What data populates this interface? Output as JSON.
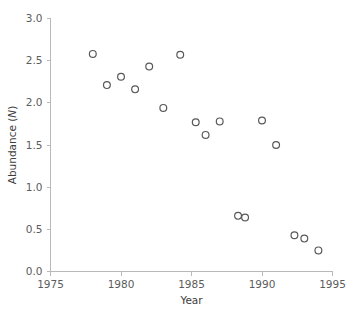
{
  "chart_data": {
    "type": "scatter",
    "title": "",
    "xlabel": "Year",
    "ylabel": "Abundance (N)",
    "ylabel_plain": "Abundance (",
    "ylabel_italic": "N",
    "ylabel_close": ")",
    "xlim": [
      1975,
      1995
    ],
    "ylim": [
      0.0,
      3.0
    ],
    "xticks": [
      1975,
      1980,
      1985,
      1990,
      1995
    ],
    "xticklabels": [
      "1975",
      "1980",
      "1985",
      "1990",
      "1995"
    ],
    "yticks": [
      0.0,
      0.5,
      1.0,
      1.5,
      2.0,
      2.5,
      3.0
    ],
    "yticklabels": [
      "0.0",
      "0.5",
      "1.0",
      "1.5",
      "2.0",
      "2.5",
      "3.0"
    ],
    "grid": false,
    "legend": null,
    "marker": "open-circle",
    "marker_color": "#585858",
    "x": [
      1978.0,
      1979.0,
      1980.0,
      1981.0,
      1981.5,
      1982.0,
      1983.0,
      1984.2,
      1985.3,
      1986.0,
      1987.0,
      1987.6,
      1988.3,
      1988.8,
      1990.0,
      1991.0,
      1992.3,
      1993.0,
      1994.0
    ],
    "y": [
      2.58,
      2.21,
      2.31,
      2.16,
      2.43,
      2.43,
      1.94,
      2.57,
      1.77,
      1.62,
      1.78,
      1.78,
      0.66,
      0.64,
      1.79,
      1.5,
      0.43,
      0.39,
      0.25
    ],
    "points": [
      {
        "year": 1978.0,
        "abundance": 2.58
      },
      {
        "year": 1979.0,
        "abundance": 2.21
      },
      {
        "year": 1980.0,
        "abundance": 2.31
      },
      {
        "year": 1981.0,
        "abundance": 2.16
      },
      {
        "year": 1982.0,
        "abundance": 2.43
      },
      {
        "year": 1983.0,
        "abundance": 1.94
      },
      {
        "year": 1984.2,
        "abundance": 2.57
      },
      {
        "year": 1985.3,
        "abundance": 1.77
      },
      {
        "year": 1986.0,
        "abundance": 1.62
      },
      {
        "year": 1987.0,
        "abundance": 1.78
      },
      {
        "year": 1988.3,
        "abundance": 0.66
      },
      {
        "year": 1988.8,
        "abundance": 0.64
      },
      {
        "year": 1990.0,
        "abundance": 1.79
      },
      {
        "year": 1991.0,
        "abundance": 1.5
      },
      {
        "year": 1992.3,
        "abundance": 0.43
      },
      {
        "year": 1993.0,
        "abundance": 0.39
      },
      {
        "year": 1994.0,
        "abundance": 0.25
      }
    ]
  }
}
